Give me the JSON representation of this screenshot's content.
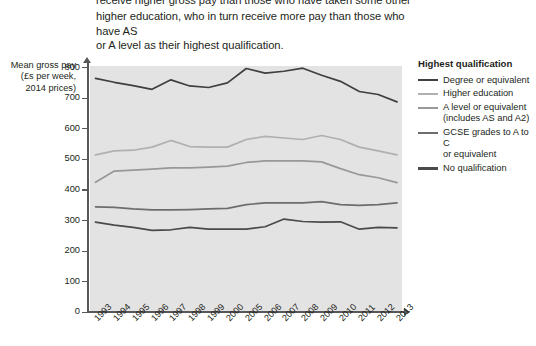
{
  "intro": {
    "line1": "receive higher gross pay than those who have taken some other form of",
    "line2": "higher education, who in turn receive more pay than those who have AS",
    "line3": "or A level as their highest qualification."
  },
  "axis_caption": {
    "line1": "Mean gross pay",
    "line2": "(£s per week,",
    "line3": "2014 prices)"
  },
  "legend": {
    "title": "Highest qualification",
    "items": [
      {
        "label": "Degree or equivalent",
        "color": "#3f3f41"
      },
      {
        "label": "Higher education",
        "color": "#b0b0b2"
      },
      {
        "label": "A level or equivalent\n(includes AS and A2)",
        "color": "#98989a"
      },
      {
        "label": "GCSE grades to A to C\nor equivalent",
        "color": "#6d6d70"
      },
      {
        "label": "No qualification",
        "color": "#4a4a4c"
      }
    ]
  },
  "chart_data": {
    "type": "line",
    "title": "",
    "xlabel": "",
    "ylabel": "Mean gross pay (£s per week, 2014 prices)",
    "ylim": [
      0,
      800
    ],
    "yticks": [
      0,
      100,
      200,
      300,
      400,
      500,
      600,
      700,
      800
    ],
    "ytick_labels": [
      "0",
      "100",
      "200",
      "300",
      "400",
      "500",
      "600",
      "700",
      "800"
    ],
    "grid": false,
    "legend_position": "right",
    "plot_background": "#e3e3e3",
    "categories": [
      "1993",
      "1994",
      "1995",
      "1996",
      "1997",
      "1998",
      "1999",
      "2000",
      "2005",
      "2006",
      "2007",
      "2008",
      "2009",
      "2010",
      "2011",
      "2012",
      "2013"
    ],
    "series": [
      {
        "name": "Degree or equivalent",
        "color": "#3f3f41",
        "values": [
          765,
          752,
          741,
          729,
          760,
          740,
          735,
          750,
          797,
          782,
          788,
          798,
          775,
          755,
          722,
          712,
          688
        ]
      },
      {
        "name": "Higher education",
        "color": "#b0b0b2",
        "values": [
          515,
          528,
          530,
          540,
          562,
          542,
          540,
          540,
          565,
          575,
          570,
          565,
          578,
          565,
          540,
          528,
          515
        ]
      },
      {
        "name": "A level or equivalent (includes AS and A2)",
        "color": "#98989a",
        "values": [
          425,
          462,
          465,
          468,
          472,
          472,
          475,
          478,
          490,
          495,
          495,
          495,
          492,
          470,
          450,
          440,
          424
        ]
      },
      {
        "name": "GCSE grades to A to C or equivalent",
        "color": "#6d6d70",
        "values": [
          345,
          343,
          338,
          335,
          335,
          336,
          338,
          340,
          352,
          358,
          358,
          358,
          362,
          352,
          350,
          352,
          358
        ]
      },
      {
        "name": "No qualification",
        "color": "#4a4a4c",
        "values": [
          295,
          285,
          278,
          268,
          270,
          278,
          272,
          272,
          272,
          280,
          305,
          297,
          295,
          296,
          272,
          278,
          276
        ]
      }
    ]
  }
}
